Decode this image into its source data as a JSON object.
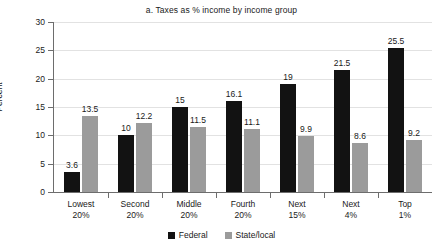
{
  "chart_data": {
    "type": "bar",
    "title": "a. Taxes as % income by income group",
    "xlabel": "",
    "ylabel": "Percent",
    "ylim": [
      0,
      30
    ],
    "ytick_values": [
      0,
      5,
      10,
      15,
      20,
      25,
      30
    ],
    "ytick_labels": [
      "0",
      "5",
      "10",
      "15",
      "20",
      "25",
      "30"
    ],
    "grid": true,
    "legend_position": "bottom-center",
    "categories": [
      {
        "line1": "Lowest",
        "line2": "20%"
      },
      {
        "line1": "Second",
        "line2": "20%"
      },
      {
        "line1": "Middle",
        "line2": "20%"
      },
      {
        "line1": "Fourth",
        "line2": "20%"
      },
      {
        "line1": "Next",
        "line2": "15%"
      },
      {
        "line1": "Next",
        "line2": "4%"
      },
      {
        "line1": "Top",
        "line2": "1%"
      }
    ],
    "series": [
      {
        "name": "Federal",
        "color": "#121212",
        "values": [
          3.6,
          10,
          15,
          16.1,
          19,
          21.5,
          25.5
        ],
        "labels": [
          "3.6",
          "10",
          "15",
          "16.1",
          "19",
          "21.5",
          "25.5"
        ]
      },
      {
        "name": "State/local",
        "color": "#9b9b9b",
        "values": [
          13.5,
          12.2,
          11.5,
          11.1,
          9.9,
          8.6,
          9.2
        ],
        "labels": [
          "13.5",
          "12.2",
          "11.5",
          "11.1",
          "9.9",
          "8.6",
          "9.2"
        ]
      }
    ]
  }
}
